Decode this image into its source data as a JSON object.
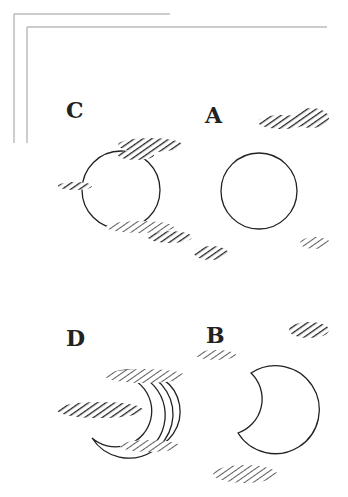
{
  "figure": {
    "panels": [
      {
        "id": "C",
        "label": "C",
        "moon": "full",
        "clouds": 4
      },
      {
        "id": "A",
        "label": "A",
        "moon": "full",
        "clouds": 2
      },
      {
        "id": "D",
        "label": "D",
        "moon": "crescent",
        "clouds": 3
      },
      {
        "id": "B",
        "label": "B",
        "moon": "crescent",
        "clouds": 3
      }
    ],
    "colors": {
      "ink": "#222222",
      "cloud": "#333333",
      "frame": "#999999",
      "background": "#ffffff"
    }
  }
}
